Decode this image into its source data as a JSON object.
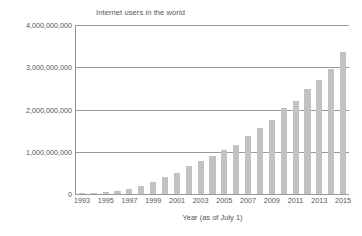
{
  "chart_data": {
    "type": "bar",
    "title": "Internet users in the world",
    "xlabel": "Year (as of July 1)",
    "ylabel": "",
    "ylim": [
      0,
      4000000000
    ],
    "grid": true,
    "legend": "none",
    "categories": [
      "1993",
      "1994",
      "1995",
      "1996",
      "1997",
      "1998",
      "1999",
      "2000",
      "2001",
      "2002",
      "2003",
      "2004",
      "2005",
      "2006",
      "2007",
      "2008",
      "2009",
      "2010",
      "2011",
      "2012",
      "2013",
      "2014",
      "2015"
    ],
    "values": [
      14000000,
      25000000,
      40000000,
      77000000,
      120000000,
      188000000,
      281000000,
      414000000,
      502000000,
      665000000,
      778000000,
      911000000,
      1030000000,
      1160000000,
      1370000000,
      1570000000,
      1750000000,
      2030000000,
      2210000000,
      2490000000,
      2710000000,
      2960000000,
      3370000000
    ],
    "y_ticks": [
      0,
      1000000000,
      2000000000,
      3000000000,
      4000000000
    ],
    "y_tick_labels": [
      "0",
      "1,000,000,000",
      "2,000,000,000",
      "3,000,000,000",
      "4,000,000,000"
    ],
    "x_tick_labels": [
      "1993",
      "1995",
      "1997",
      "1999",
      "2001",
      "2003",
      "2005",
      "2007",
      "2009",
      "2011",
      "2013",
      "2015"
    ],
    "bar_color": "#c2c2c2",
    "gridline_color": "#9a9a9a",
    "axis_color": "#8f8f8f",
    "text_color": "#555555"
  }
}
